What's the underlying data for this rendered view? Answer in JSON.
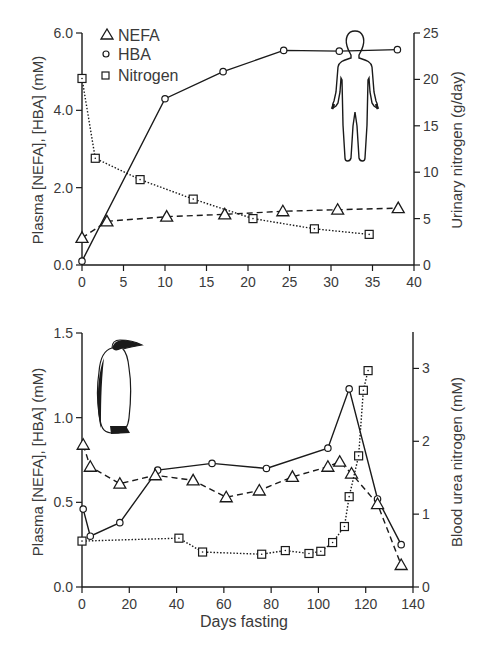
{
  "chart_data": [
    {
      "type": "line",
      "title": "",
      "subject": "human",
      "xlabel": "",
      "ylabel": "Plasma [NEFA], [HBA] (mM)",
      "y2label": "Urinary nitrogen (g/day)",
      "xlim": [
        0,
        40
      ],
      "ylim": [
        0,
        6.0
      ],
      "y2lim": [
        0,
        25
      ],
      "xticks": [
        "0",
        "5",
        "10",
        "15",
        "20",
        "25",
        "30",
        "35",
        "40"
      ],
      "yticks": [
        "0.0",
        "2.0",
        "4.0",
        "6.0"
      ],
      "y2ticks": [
        "0",
        "5",
        "10",
        "15",
        "20",
        "25"
      ],
      "grid": false,
      "legend": {
        "position": "upper-left",
        "entries": [
          {
            "label": "NEFA",
            "marker": "triangle"
          },
          {
            "label": "HBA",
            "marker": "circle"
          },
          {
            "label": "Nitrogen",
            "marker": "square"
          }
        ]
      },
      "series": [
        {
          "name": "HBA",
          "axis": "left",
          "line": "solid",
          "marker": "circle",
          "x": [
            0,
            10,
            17,
            24.3,
            31,
            38
          ],
          "y": [
            0.1,
            4.3,
            5.0,
            5.55,
            5.53,
            5.57
          ]
        },
        {
          "name": "NEFA",
          "axis": "left",
          "line": "dashed",
          "marker": "triangle",
          "x": [
            0,
            3,
            10.2,
            17.2,
            24.2,
            30.8,
            38.1
          ],
          "y": [
            0.7,
            1.13,
            1.25,
            1.31,
            1.39,
            1.43,
            1.47
          ]
        },
        {
          "name": "Nitrogen",
          "axis": "right",
          "line": "dotted",
          "marker": "square",
          "x": [
            0,
            1.6,
            7,
            13.4,
            20.6,
            28,
            34.6
          ],
          "y": [
            20.1,
            11.5,
            9.2,
            7.1,
            5.0,
            3.9,
            3.3
          ]
        }
      ]
    },
    {
      "type": "line",
      "title": "",
      "subject": "emperor penguin",
      "xlabel": "Days fasting",
      "ylabel": "Plasma [NEFA], [HBA] (mM)",
      "y2label": "Blood urea nitrogen (mM)",
      "xlim": [
        0,
        140
      ],
      "ylim": [
        0,
        1.5
      ],
      "y2lim": [
        0,
        3.5
      ],
      "xticks": [
        "0",
        "20",
        "40",
        "60",
        "80",
        "100",
        "120",
        "140"
      ],
      "yticks": [
        "0.0",
        "0.5",
        "1.0",
        "1.5"
      ],
      "y2ticks": [
        "0",
        "1",
        "2",
        "3"
      ],
      "grid": false,
      "series": [
        {
          "name": "HBA",
          "axis": "left",
          "line": "solid",
          "marker": "circle",
          "x": [
            0.5,
            3.5,
            16,
            32,
            55,
            78,
            104,
            113,
            125,
            135
          ],
          "y": [
            0.46,
            0.3,
            0.38,
            0.69,
            0.73,
            0.7,
            0.82,
            1.17,
            0.52,
            0.25
          ]
        },
        {
          "name": "NEFA",
          "axis": "left",
          "line": "dashed",
          "marker": "triangle",
          "x": [
            0.5,
            3.5,
            16,
            31,
            47,
            61,
            75,
            89,
            104,
            109,
            114,
            125,
            135
          ],
          "y": [
            0.84,
            0.71,
            0.61,
            0.66,
            0.63,
            0.53,
            0.57,
            0.65,
            0.71,
            0.74,
            0.67,
            0.49,
            0.13
          ]
        },
        {
          "name": "Nitrogen",
          "axis": "right",
          "line": "dotted",
          "marker": "square",
          "x": [
            0,
            41,
            51,
            76,
            86,
            96,
            101,
            106,
            111,
            113,
            117,
            119,
            121
          ],
          "y": [
            0.63,
            0.67,
            0.48,
            0.45,
            0.5,
            0.46,
            0.49,
            0.61,
            0.83,
            1.24,
            1.8,
            2.7,
            2.97
          ]
        }
      ]
    }
  ],
  "labels": {
    "top_ylabel": "Plasma [NEFA], [HBA] (mM)",
    "top_y2label": "Urinary nitrogen (g/day)",
    "bottom_ylabel": "Plasma [NEFA], [HBA] (mM)",
    "bottom_y2label": "Blood urea nitrogen (mM)",
    "xlabel": "Days fasting",
    "legend": [
      "NEFA",
      "HBA",
      "Nitrogen"
    ]
  },
  "icons": {
    "top": "human-silhouette-icon",
    "bottom": "penguin-silhouette-icon"
  },
  "colors": {
    "ink": "#1a1a1a",
    "text": "#3a3a3a",
    "background": "#ffffff"
  }
}
